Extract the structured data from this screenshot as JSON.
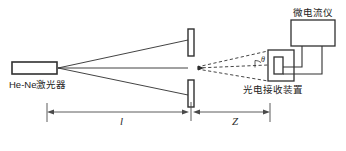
{
  "figure": {
    "background": "#ffffff",
    "stroke_color": "#303030",
    "text_color": "#232323",
    "width": 346,
    "height": 151
  },
  "labels": {
    "laser": "He-Ne激光器",
    "detector": "光电接收装置",
    "meter": "微电流仪",
    "distance_l": "l",
    "distance_z": "Z",
    "angle_theta": "θ"
  },
  "components": {
    "laser_source": {
      "name": "He-Ne激光器",
      "shape": "rectangle",
      "x": 12,
      "y": 62,
      "width": 45,
      "height": 12
    },
    "slit_plate_upper": {
      "name": "slit-plate-upper",
      "shape": "rectangle",
      "x": 188,
      "y": 29,
      "width": 6,
      "height": 27
    },
    "slit_plate_lower": {
      "name": "slit-plate-lower",
      "shape": "rectangle",
      "x": 188,
      "y": 80,
      "width": 6,
      "height": 27
    },
    "detector_box": {
      "name": "光电接收装置",
      "shape": "rectangle",
      "x": 268,
      "y": 50,
      "width": 26,
      "height": 31
    },
    "detector_window": {
      "name": "detector-window",
      "shape": "rectangle",
      "x": 274,
      "y": 57,
      "width": 9,
      "height": 17
    },
    "micro_ammeter": {
      "name": "微电流仪",
      "shape": "rectangle",
      "x": 291,
      "y": 20,
      "width": 44,
      "height": 26
    }
  },
  "beams": {
    "converge_point": {
      "x": 58,
      "y": 68
    },
    "solid_rays": [
      {
        "name": "upper-ray",
        "from": [
          58,
          68
        ],
        "to": [
          188,
          40
        ]
      },
      {
        "name": "axis-ray",
        "from": [
          58,
          68
        ],
        "to": [
          188,
          68
        ]
      },
      {
        "name": "lower-ray",
        "from": [
          58,
          68
        ],
        "to": [
          188,
          95
        ]
      }
    ],
    "dashed_rays": [
      {
        "name": "diffracted-ray-upper",
        "from": [
          196,
          68
        ],
        "to": [
          268,
          52
        ]
      },
      {
        "name": "diffracted-ray-lower",
        "from": [
          196,
          68
        ],
        "to": [
          268,
          80
        ]
      }
    ],
    "center_dashed_axis": {
      "from": [
        196,
        68
      ],
      "to": [
        268,
        66
      ]
    }
  },
  "dimensions": {
    "baseline_y": 112,
    "ticks": [
      {
        "name": "tick-left",
        "x": 47
      },
      {
        "name": "tick-middle",
        "x": 191
      },
      {
        "name": "tick-right",
        "x": 270
      }
    ],
    "segments": [
      {
        "name": "segment-l",
        "label": "l",
        "from_x": 47,
        "to_x": 188
      },
      {
        "name": "segment-z",
        "label": "Z",
        "from_x": 195,
        "to_x": 270
      }
    ]
  },
  "wiring": {
    "wires": [
      {
        "name": "meter-wire-left",
        "path": "M 302,46 L 302,68 L 283,68"
      },
      {
        "name": "meter-wire-right",
        "path": "M 322,46 L 322,74 L 283,74"
      }
    ]
  }
}
